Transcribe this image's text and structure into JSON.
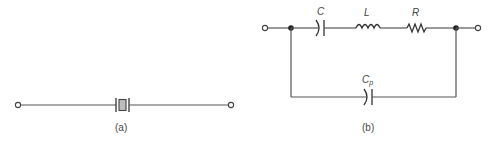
{
  "figure": {
    "panel_a": {
      "caption": "(a)",
      "components": [
        {
          "type": "terminal",
          "id": "a-left"
        },
        {
          "type": "quartz-crystal",
          "id": "a-crystal"
        },
        {
          "type": "terminal",
          "id": "a-right"
        }
      ]
    },
    "panel_b": {
      "caption": "(b)",
      "labels": {
        "C": "C",
        "L": "L",
        "R": "R",
        "Cp_main": "C",
        "Cp_sub": "p"
      },
      "components": [
        {
          "type": "terminal",
          "id": "b-left"
        },
        {
          "type": "junction-node",
          "id": "b-node-left"
        },
        {
          "type": "capacitor",
          "label": "C"
        },
        {
          "type": "inductor",
          "label": "L"
        },
        {
          "type": "resistor",
          "label": "R"
        },
        {
          "type": "junction-node",
          "id": "b-node-right"
        },
        {
          "type": "terminal",
          "id": "b-right"
        },
        {
          "type": "capacitor",
          "label": "Cp"
        }
      ]
    },
    "colors": {
      "wire": "#555555",
      "component": "#333333",
      "crystal_fill": "#bdbdbd",
      "background": "#ffffff"
    }
  }
}
